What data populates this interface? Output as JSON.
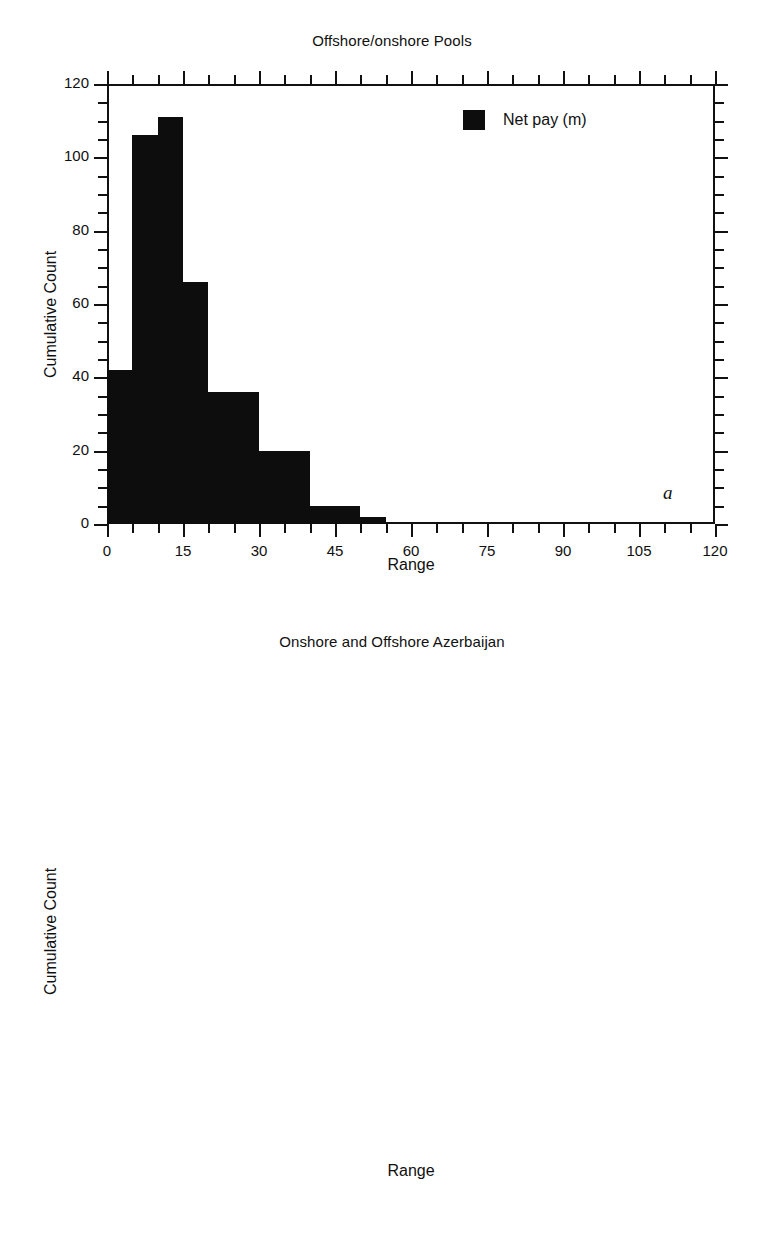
{
  "figure": {
    "panels": [
      {
        "id": "a",
        "letter": "a",
        "title": "Offshore/onshore Pools",
        "legend_label": "Net pay (m)",
        "legend_color": "#0d0d0d",
        "xlabel": "Range",
        "ylabel": "Cumulative Count"
      },
      {
        "id": "b",
        "letter": "b",
        "title": "Onshore and Offshore Azerbaijan",
        "legend_label": "Total Thickness (m)",
        "legend_color": "#0d0d0d",
        "xlabel": "Range",
        "ylabel": "Cumulative Count"
      }
    ]
  },
  "chart_data": [
    {
      "type": "bar",
      "id": "a",
      "title": "Offshore/onshore Pools",
      "xlabel": "Range",
      "ylabel": "Cumulative Count",
      "legend": [
        "Net pay (m)"
      ],
      "legend_position": "top-right inside",
      "grid": false,
      "xlim": [
        0,
        120
      ],
      "ylim": [
        0,
        120
      ],
      "xticks": [
        0,
        15,
        30,
        45,
        60,
        75,
        90,
        105,
        120
      ],
      "xtick_labels": [
        "0",
        "15",
        "30",
        "45",
        "60",
        "75",
        "90",
        "105",
        "120"
      ],
      "x_minor_tick_step": 5,
      "yticks": [
        0,
        20,
        40,
        60,
        80,
        100,
        120
      ],
      "ytick_labels": [
        "0",
        "20",
        "40",
        "60",
        "80",
        "100",
        "120"
      ],
      "y_minor_tick_step": 5,
      "bin_width": 5,
      "bin_starts": [
        0,
        5,
        10,
        15,
        20,
        25,
        30,
        35,
        40,
        45,
        50,
        55,
        60,
        65,
        70,
        75,
        80,
        85,
        90,
        95,
        100,
        105,
        110,
        115
      ],
      "values": [
        42,
        106,
        111,
        66,
        36,
        36,
        20,
        20,
        5,
        5,
        2,
        0,
        0,
        0,
        0,
        0,
        0,
        0,
        0,
        0,
        0,
        0,
        0,
        0
      ],
      "series": [
        {
          "name": "Net pay (m)",
          "values": [
            42,
            106,
            111,
            66,
            36,
            36,
            20,
            20,
            5,
            5,
            2,
            0,
            0,
            0,
            0,
            0,
            0,
            0,
            0,
            0,
            0,
            0,
            0,
            0
          ]
        }
      ]
    },
    {
      "type": "bar",
      "id": "b",
      "title": "Onshore and Offshore Azerbaijan",
      "xlabel": "Range",
      "ylabel": "Cumulative Count",
      "legend": [
        "Total Thickness (m)"
      ],
      "legend_position": "top-right inside",
      "grid": false,
      "xlim": [
        0,
        600
      ],
      "ylim": [
        0,
        12
      ],
      "xticks": [
        0,
        100,
        200,
        300,
        400,
        500,
        600
      ],
      "xtick_labels": [
        "0",
        "100",
        "200",
        "300",
        "400",
        "500",
        "600"
      ],
      "x_minor_tick_step": 25,
      "yticks": [
        0,
        2,
        4,
        6,
        8,
        10,
        12
      ],
      "ytick_labels": [
        "0",
        "2",
        "4",
        "6",
        "8",
        "10",
        "12"
      ],
      "y_minor_tick_step": 0.5,
      "bin_width": 25,
      "bin_starts": [
        0,
        25,
        50,
        75,
        100,
        125,
        150,
        175,
        200,
        225,
        250,
        275,
        300,
        325,
        350,
        375,
        400,
        425,
        450,
        475,
        500,
        525,
        550,
        575
      ],
      "values": [
        11,
        10,
        11,
        2,
        7,
        1,
        2,
        2,
        2,
        0,
        1,
        0,
        0,
        3,
        0,
        0,
        0,
        0,
        1,
        0,
        0,
        2,
        0,
        0
      ],
      "series": [
        {
          "name": "Total Thickness (m)",
          "values": [
            11,
            10,
            11,
            2,
            7,
            1,
            2,
            2,
            2,
            0,
            1,
            0,
            0,
            3,
            0,
            0,
            0,
            0,
            1,
            0,
            0,
            2,
            0,
            0
          ]
        }
      ]
    }
  ]
}
